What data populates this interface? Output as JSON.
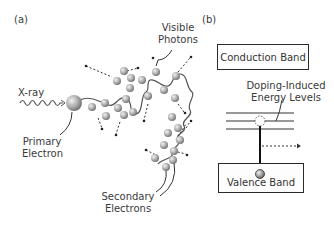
{
  "panel_a": {
    "label": "(a)",
    "xray_label": "X-ray",
    "primary_electron_label_line1": "Primary",
    "primary_electron_label_line2": "Electron",
    "visible_photons_label_line1": "Visible",
    "visible_photons_label_line2": "Photons",
    "secondary_electrons_label_line1": "Secondary",
    "secondary_electrons_label_line2": "Electrons"
  },
  "panel_b": {
    "label": "(b)",
    "conduction_band_label": "Conduction Band",
    "doping_levels_label_line1": "Doping-Induced",
    "doping_levels_label_line2": "Energy Levels",
    "valence_band_label": "Valence Band"
  },
  "colors": {
    "line": "#444444",
    "ball_light": "#e6e6e6",
    "ball_dark": "#7a7a7a"
  }
}
